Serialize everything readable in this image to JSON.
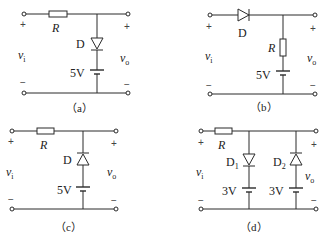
{
  "circuits": [
    {
      "id": "a",
      "caption": "（a）",
      "input_label": "v",
      "input_sub": "i",
      "output_label": "v",
      "output_sub": "o",
      "plus": "+",
      "minus": "−",
      "resistor_label": "R",
      "diode_label": "D",
      "diode_orientation": "anode-top (cathode down, toward battery)",
      "battery_label": "5V"
    },
    {
      "id": "b",
      "caption": "（b）",
      "input_label": "v",
      "input_sub": "i",
      "output_label": "v",
      "output_sub": "o",
      "plus": "+",
      "minus": "−",
      "resistor_label": "R",
      "diode_label": "D",
      "diode_orientation": "series, pointing right",
      "battery_label": "5V"
    },
    {
      "id": "c",
      "caption": "（c）",
      "input_label": "v",
      "input_sub": "i",
      "output_label": "v",
      "output_sub": "o",
      "plus": "+",
      "minus": "−",
      "resistor_label": "R",
      "diode_label": "D",
      "diode_orientation": "cathode-top (pointing up)",
      "battery_label": "5V"
    },
    {
      "id": "d",
      "caption": "（d）",
      "input_label": "v",
      "input_sub": "i",
      "output_label": "v",
      "output_sub": "o",
      "plus": "+",
      "minus": "−",
      "resistor_label": "R",
      "diode1_label": "D",
      "diode1_sub": "1",
      "diode1_orientation": "pointing down",
      "diode2_label": "D",
      "diode2_sub": "2",
      "diode2_orientation": "pointing up",
      "battery1_label": "3V",
      "battery2_label": "3V"
    }
  ]
}
